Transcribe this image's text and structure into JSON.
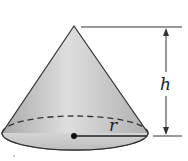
{
  "diagram": {
    "shape": "right circular cone",
    "labels": {
      "height": "h",
      "radius": "r"
    },
    "colors": {
      "fill_light": "#e4e4e4",
      "fill_dark": "#a8a8a8",
      "base_fill": "#c9c9c9",
      "stroke": "#333333"
    }
  }
}
